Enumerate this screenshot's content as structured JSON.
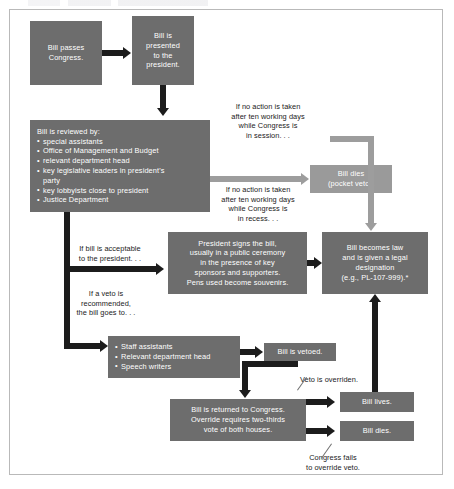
{
  "diagram": {
    "title_partial": "",
    "nodes": {
      "bill_passes": "Bill passes Congress.",
      "bill_presented_l1": "Bill is",
      "bill_presented_l2": "presented",
      "bill_presented_l3": "to the",
      "bill_presented_l4": "president.",
      "review_header": "Bill is reviewed by:",
      "review_items": [
        "special assistants",
        "Office of Management and Budget",
        "relevant department head",
        "key legislative leaders in president's",
        "party",
        "key lobbyists close to president",
        "Justice Department"
      ],
      "bill_dies_pocket_l1": "Bill dies",
      "bill_dies_pocket_l2": "(pocket veto).",
      "president_signs_l1": "President signs the bill,",
      "president_signs_l2": "usually in a public ceremony",
      "president_signs_l3": "in the presence of key",
      "president_signs_l4": "sponsors and supporters.",
      "president_signs_l5": "Pens used become souvenirs.",
      "becomes_law_l1": "Bill becomes law",
      "becomes_law_l2": "and is given a legal",
      "becomes_law_l3": "designation",
      "becomes_law_l4": "(e.g., PL-107-999).*",
      "staff_items": [
        "Staff assistants",
        "Relevant department head",
        "Speech writers"
      ],
      "bill_vetoed": "Bill is vetoed.",
      "returned_l1": "Bill is returned to Congress.",
      "returned_l2": "Override requires two-thirds",
      "returned_l3": "vote of both houses.",
      "bill_lives": "Bill lives.",
      "bill_dies": "Bill dies."
    },
    "annotations": {
      "no_action_session_l1": "If no action is taken",
      "no_action_session_l2": "after ten working days",
      "no_action_session_l3": "while Congress is",
      "no_action_session_l4": "in session. . .",
      "no_action_recess_l1": "If no action is taken",
      "no_action_recess_l2": "after ten working days",
      "no_action_recess_l3": "while Congress is",
      "no_action_recess_l4": "in recess. . .",
      "acceptable_l1": "If bill is acceptable",
      "acceptable_l2": "to the president. . .",
      "veto_recommended_l1": "If a veto is",
      "veto_recommended_l2": "recommended,",
      "veto_recommended_l3": "the bill goes to. . .",
      "veto_overridden": "Veto is overriden.",
      "congress_fails_l1": "Congress fails",
      "congress_fails_l2": "to override veto."
    },
    "colors": {
      "box_dark": "#6d6d6d",
      "box_light": "#9a9a9a",
      "arrow_dark": "#1c1c1c",
      "arrow_light": "#9d9d9d",
      "text_on_box": "#ffffff",
      "text_note": "#1a1a1a",
      "frame_border": "#b9b9b9",
      "background": "#ffffff"
    }
  }
}
